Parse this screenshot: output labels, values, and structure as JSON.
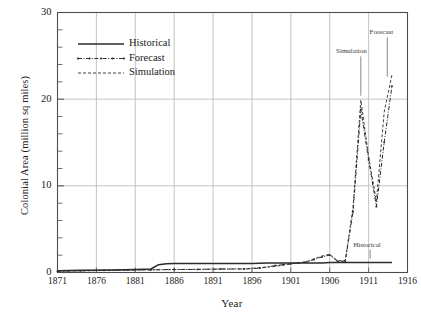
{
  "chart_data": {
    "type": "line",
    "title": "",
    "xlabel": "Year",
    "ylabel": "Colonial Area (million sq miles)",
    "xlim": [
      1871,
      1916
    ],
    "ylim": [
      0,
      30
    ],
    "xticks": [
      1871,
      1876,
      1881,
      1886,
      1891,
      1896,
      1901,
      1906,
      1911,
      1916
    ],
    "yticks": [
      0,
      10,
      20,
      30
    ],
    "y_minor_tick_step": 2,
    "grid": true,
    "legend_position": "upper-left",
    "series": [
      {
        "name": "Historical",
        "style": "solid",
        "x": [
          1871,
          1874,
          1878,
          1881,
          1883,
          1884,
          1885,
          1886,
          1890,
          1893,
          1896,
          1898,
          1900,
          1901,
          1902,
          1903,
          1904,
          1905,
          1906,
          1907,
          1908,
          1909,
          1910,
          1911,
          1912,
          1913,
          1914
        ],
        "y": [
          0.2,
          0.25,
          0.3,
          0.35,
          0.4,
          0.9,
          1.0,
          1.05,
          1.05,
          1.05,
          1.05,
          1.1,
          1.1,
          1.1,
          1.1,
          1.1,
          1.1,
          1.1,
          1.15,
          1.15,
          1.15,
          1.15,
          1.15,
          1.15,
          1.15,
          1.15,
          1.15
        ]
      },
      {
        "name": "Forecast",
        "style": "dash-dot-markers",
        "x": [
          1871,
          1874,
          1877,
          1880,
          1883,
          1886,
          1889,
          1892,
          1895,
          1897,
          1899,
          1900,
          1901,
          1902,
          1903,
          1904,
          1905,
          1906,
          1907,
          1908,
          1909,
          1910,
          1911,
          1912,
          1913,
          1914
        ],
        "y": [
          0.15,
          0.2,
          0.25,
          0.3,
          0.3,
          0.35,
          0.35,
          0.4,
          0.4,
          0.5,
          0.8,
          0.9,
          1.0,
          1.1,
          1.2,
          1.5,
          1.8,
          2.0,
          1.3,
          1.3,
          7.0,
          18.8,
          13.0,
          7.6,
          15.0,
          21.5
        ]
      },
      {
        "name": "Simulation",
        "style": "dashed",
        "x": [
          1871,
          1875,
          1880,
          1885,
          1890,
          1895,
          1899,
          1901,
          1903,
          1905,
          1906,
          1907,
          1908,
          1909,
          1910,
          1911,
          1912,
          1913,
          1914
        ],
        "y": [
          0.15,
          0.2,
          0.28,
          0.33,
          0.38,
          0.42,
          0.7,
          1.0,
          1.25,
          1.9,
          2.1,
          1.35,
          1.4,
          7.6,
          19.9,
          13.4,
          8.2,
          18.5,
          22.8
        ]
      }
    ],
    "annotations": [
      {
        "text": "Simulation",
        "label_x": 1909.0,
        "label_y": 25.4,
        "point_x": 1910.0,
        "point_y": 20.4
      },
      {
        "text": "Forecast",
        "label_x": 1913.3,
        "label_y": 27.6,
        "point_x": 1913.4,
        "point_y": 22.6
      },
      {
        "text": "Historical",
        "label_x": 1911.2,
        "label_y": 3.1,
        "point_x": 1911.2,
        "point_y": 1.6
      }
    ]
  },
  "legend": {
    "items": [
      {
        "label": "Historical",
        "style": "solid"
      },
      {
        "label": "Forecast",
        "style": "dash-dot-markers"
      },
      {
        "label": "Simulation",
        "style": "dashed"
      }
    ]
  },
  "colors": {
    "line": "#2b2b2b",
    "grid": "#b4b4b4",
    "axis": "#4d4d4d",
    "text": "#1a1a1a",
    "background": "#ffffff"
  }
}
